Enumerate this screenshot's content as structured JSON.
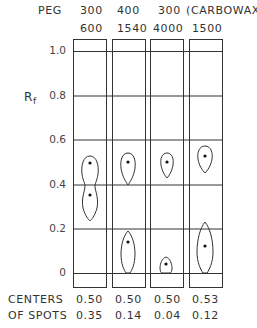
{
  "header": {
    "row1_label": "PEG",
    "row1": [
      "300",
      "400",
      "300",
      "(CARBOWAX)"
    ],
    "row2": [
      "600",
      "1540",
      "4000",
      "1500"
    ]
  },
  "axis": {
    "label": "R",
    "label_sub": "f",
    "ticks": [
      "1.0",
      "0.8",
      "0.6",
      "0.4",
      "0.2",
      "0"
    ]
  },
  "footer": {
    "row1_label": "CENTERS",
    "row2_label": "OF SPOTS",
    "row1": [
      "0.50",
      "0.50",
      "0.50",
      "0.53"
    ],
    "row2": [
      "0.35",
      "0.14",
      "0.04",
      "0.12"
    ]
  },
  "lanes": [
    {
      "name": "PEG 300/600",
      "spots_rf": [
        0.5,
        0.35
      ]
    },
    {
      "name": "PEG 400/1540",
      "spots_rf": [
        0.5,
        0.14
      ]
    },
    {
      "name": "PEG 300/4000",
      "spots_rf": [
        0.5,
        0.04
      ]
    },
    {
      "name": "Carbowax 1500",
      "spots_rf": [
        0.53,
        0.12
      ]
    }
  ],
  "colors": {
    "line": "#333333",
    "background": "#ffffff"
  }
}
